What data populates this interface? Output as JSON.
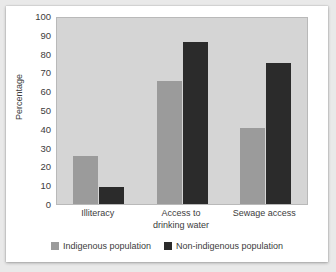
{
  "top_artifact_text": "",
  "chart_data": {
    "type": "bar",
    "title": "",
    "subtitle": "",
    "xlabel": "",
    "ylabel": "Percentage",
    "ylim": [
      0,
      100
    ],
    "ytick_step": 10,
    "ytick_labels": [
      "100",
      "90",
      "80",
      "70",
      "60",
      "50",
      "40",
      "30",
      "20",
      "10",
      "0"
    ],
    "ytick_values": [
      100,
      90,
      80,
      70,
      60,
      50,
      40,
      30,
      20,
      10,
      0
    ],
    "grid": false,
    "legend_position": "bottom-center",
    "categories": [
      "Illiteracy",
      "Access to drinking water",
      "Sewage access"
    ],
    "category_label_lines": [
      [
        "Illiteracy"
      ],
      [
        "Access to",
        "drinking water"
      ],
      [
        "Sewage access"
      ]
    ],
    "series": [
      {
        "name": "Indigenous population",
        "color": "#9b9b9b",
        "values": [
          26,
          66,
          41
        ]
      },
      {
        "name": "Non-indigenous population",
        "color": "#2b2b2b",
        "values": [
          9,
          87,
          76
        ]
      }
    ],
    "plot_background": "#d5d5d5",
    "page_background": "#e9e9e9",
    "card_background": "#ffffff",
    "text_color": "#3c3c3c"
  }
}
